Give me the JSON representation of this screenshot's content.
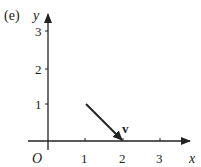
{
  "figure": {
    "part_label": "(e)",
    "x_axis_label": "x",
    "y_axis_label": "y",
    "origin_label": "O",
    "x_ticks": [
      "1",
      "2",
      "3"
    ],
    "y_ticks": [
      "1",
      "2",
      "3"
    ],
    "vector": {
      "label": "v",
      "from": [
        1,
        1
      ],
      "to": [
        2,
        0
      ]
    },
    "colors": {
      "ink": "#222222",
      "background": "#ffffff"
    }
  }
}
